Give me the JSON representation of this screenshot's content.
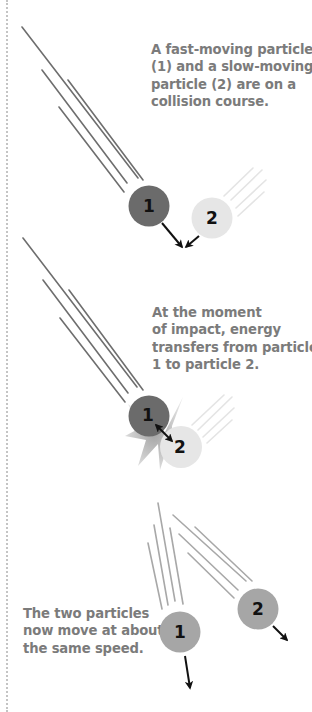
{
  "colors": {
    "fast_particle": "#6b6b6b",
    "slow_particle": "#e6e6e6",
    "after_particle": "#a6a6a6",
    "trail_dark": "#6e6e6e",
    "trail_light": "#e2e2e2",
    "trail_after": "#a8a8a8",
    "caption_text": "#7b7b7b",
    "arrow": "#111111",
    "burst": "#bdbdbd"
  },
  "scenes": [
    {
      "id": "approach",
      "caption": {
        "lines": [
          "A fast-moving particle",
          "(1) and a slow-moving",
          "particle (2) are on a",
          "collision course."
        ]
      },
      "particles": [
        {
          "label": "1",
          "role": "fast-moving particle"
        },
        {
          "label": "2",
          "role": "slow-moving particle"
        }
      ]
    },
    {
      "id": "impact",
      "caption": {
        "lines": [
          "At the moment",
          "of impact, energy",
          "transfers from particle",
          "1 to particle 2."
        ]
      },
      "particles": [
        {
          "label": "1",
          "role": "fast-moving particle"
        },
        {
          "label": "2",
          "role": "slow-moving particle"
        }
      ]
    },
    {
      "id": "after",
      "caption": {
        "lines": [
          "The two particles",
          "now move at about",
          "the same speed."
        ]
      },
      "particles": [
        {
          "label": "1",
          "role": "particle after collision"
        },
        {
          "label": "2",
          "role": "particle after collision"
        }
      ]
    }
  ]
}
